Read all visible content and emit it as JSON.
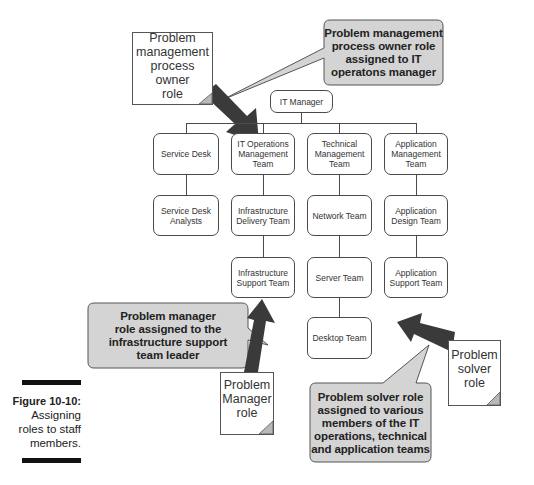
{
  "figure": {
    "number": "Figure 10-10:",
    "caption_lines": [
      "Assigning",
      "roles to staff",
      "members."
    ]
  },
  "org_chart": {
    "root": "IT Manager",
    "columns": [
      {
        "head": [
          "Service Desk"
        ],
        "children": [
          [
            "Service Desk",
            "Analysts"
          ]
        ]
      },
      {
        "head": [
          "IT Operations",
          "Management",
          "Team"
        ],
        "children": [
          [
            "Infrastructure",
            "Delivery Team"
          ],
          [
            "Infrastructure",
            "Support Team"
          ]
        ]
      },
      {
        "head": [
          "Technical",
          "Management",
          "Team"
        ],
        "children": [
          [
            "Network Team"
          ],
          [
            "Server Team"
          ],
          [
            "Desktop Team"
          ]
        ]
      },
      {
        "head": [
          "Application",
          "Management",
          "Team"
        ],
        "children": [
          [
            "Application",
            "Design Team"
          ],
          [
            "Application",
            "Support Team"
          ]
        ]
      }
    ]
  },
  "role_notes": {
    "owner": [
      "Problem",
      "management",
      "process owner",
      "role"
    ],
    "manager": [
      "Problem",
      "Manager",
      "role"
    ],
    "solver": [
      "Problem",
      "solver",
      "role"
    ]
  },
  "callouts": {
    "owner": [
      "Problem management",
      "process owner role",
      "assigned to IT",
      "operatons manager"
    ],
    "manager": [
      "Problem manager",
      "role assigned to the",
      "infrastructure support",
      "team leader"
    ],
    "solver": [
      "Problem solver role",
      "assigned to various",
      "members of the IT",
      "operations, technical",
      "and application teams"
    ]
  },
  "colors": {
    "arrow": "#3a3a3a",
    "callout_fill": "#d4d4d4",
    "box_border": "#4a4a4a",
    "fold": "#b8b8b8"
  }
}
